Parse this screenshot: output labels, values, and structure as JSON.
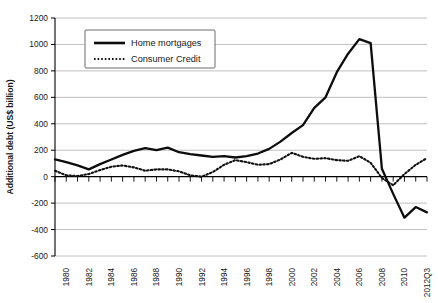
{
  "chart_data": {
    "type": "line",
    "title": "",
    "xlabel": "",
    "ylabel": "Additional debt (US$ billion)",
    "ylim": [
      -600,
      1200
    ],
    "ytick_values": [
      1200,
      1000,
      800,
      600,
      400,
      200,
      0,
      -200,
      -400,
      -600
    ],
    "ytick_labels": [
      "1200",
      "1000",
      "800",
      "600",
      "400",
      "200",
      "0",
      "-200",
      "-400",
      "-600"
    ],
    "grid": true,
    "legend_position": "top-left-inside",
    "x": [
      "1979",
      "1980",
      "1981",
      "1982",
      "1983",
      "1984",
      "1985",
      "1986",
      "1987",
      "1988",
      "1989",
      "1990",
      "1991",
      "1992",
      "1993",
      "1994",
      "1995",
      "1996",
      "1997",
      "1998",
      "1999",
      "2000",
      "2001",
      "2002",
      "2003",
      "2004",
      "2005",
      "2006",
      "2007",
      "2008",
      "2009",
      "2010",
      "2011",
      "2012Q3"
    ],
    "xtick_labels": [
      "1980",
      "1982",
      "1984",
      "1986",
      "1988",
      "1990",
      "1992",
      "1994",
      "1996",
      "1998",
      "2000",
      "2002",
      "2004",
      "2006",
      "2008",
      "2010",
      "2012Q3"
    ],
    "xtick_label_years": [
      1980,
      1982,
      1984,
      1986,
      1988,
      1990,
      1992,
      1994,
      1996,
      1998,
      2000,
      2002,
      2004,
      2006,
      2008,
      2010,
      2012
    ],
    "series": [
      {
        "name": "Home mortgages",
        "style": "solid",
        "color": "#0d0d0d",
        "values": [
          130,
          110,
          85,
          55,
          95,
          130,
          165,
          195,
          215,
          200,
          220,
          185,
          170,
          160,
          150,
          155,
          145,
          155,
          175,
          210,
          265,
          330,
          390,
          520,
          600,
          790,
          930,
          1040,
          1010,
          60,
          -130,
          -310,
          -230,
          -270
        ]
      },
      {
        "name": "Consumer Credit",
        "style": "dotted",
        "color": "#111111",
        "values": [
          45,
          10,
          5,
          20,
          50,
          75,
          85,
          70,
          45,
          55,
          55,
          40,
          10,
          0,
          35,
          90,
          125,
          110,
          90,
          95,
          130,
          180,
          150,
          135,
          140,
          125,
          120,
          155,
          105,
          -10,
          -65,
          20,
          90,
          140
        ]
      }
    ],
    "legend": [
      {
        "label": "Home mortgages",
        "style": "solid"
      },
      {
        "label": "Consumer Credit",
        "style": "dotted"
      }
    ]
  }
}
